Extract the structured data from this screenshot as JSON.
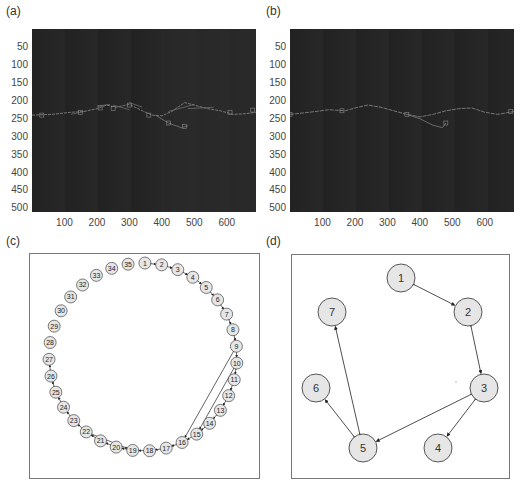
{
  "panels": {
    "a": {
      "label": "(a)"
    },
    "b": {
      "label": "(b)"
    },
    "c": {
      "label": "(c)"
    },
    "d": {
      "label": "(d)"
    }
  },
  "chart_data": [
    {
      "panel": "(a)",
      "type": "heatmap",
      "title": "",
      "description": "Grayscale image with many overlaid detected segments (boxes/lines) tracing a horizon near y=200-280",
      "xlabel": "",
      "ylabel": "",
      "xlim": [
        0,
        690
      ],
      "ylim": [
        510,
        0
      ],
      "xticks": [
        100,
        200,
        300,
        400,
        500,
        600
      ],
      "yticks": [
        50,
        100,
        150,
        200,
        250,
        300,
        350,
        400,
        450,
        500
      ],
      "trace": {
        "x": [
          0,
          60,
          120,
          160,
          200,
          230,
          260,
          300,
          340,
          370,
          400,
          430,
          470,
          500,
          540,
          580,
          620,
          660,
          690
        ],
        "y": [
          240,
          238,
          232,
          230,
          222,
          212,
          218,
          210,
          228,
          240,
          242,
          230,
          205,
          212,
          222,
          228,
          238,
          236,
          232
        ]
      },
      "branch": {
        "x": [
          380,
          420,
          460,
          480
        ],
        "y": [
          240,
          262,
          275,
          270
        ]
      },
      "grid": false
    },
    {
      "panel": "(b)",
      "type": "heatmap",
      "title": "",
      "description": "Grayscale image with a single cleaned horizon trace",
      "xlabel": "",
      "ylabel": "",
      "xlim": [
        0,
        690
      ],
      "ylim": [
        510,
        0
      ],
      "xticks": [
        100,
        200,
        300,
        400,
        500,
        600
      ],
      "yticks": [
        50,
        100,
        150,
        200,
        250,
        300,
        350,
        400,
        450,
        500
      ],
      "trace": {
        "x": [
          0,
          60,
          120,
          170,
          200,
          240,
          280,
          320,
          360,
          400,
          440,
          480,
          520,
          560,
          600,
          640,
          690
        ],
        "y": [
          238,
          232,
          225,
          228,
          220,
          212,
          218,
          228,
          238,
          245,
          238,
          228,
          222,
          220,
          232,
          238,
          230
        ]
      },
      "branch": {
        "x": [
          360,
          400,
          440,
          470,
          480
        ],
        "y": [
          238,
          250,
          268,
          275,
          262
        ]
      },
      "grid": false
    }
  ],
  "graph_c": {
    "node_count": 35,
    "nodes": [
      "1",
      "2",
      "3",
      "4",
      "5",
      "6",
      "7",
      "8",
      "9",
      "10",
      "11",
      "12",
      "13",
      "14",
      "15",
      "16",
      "17",
      "18",
      "19",
      "20",
      "21",
      "22",
      "23",
      "24",
      "25",
      "26",
      "27",
      "28",
      "29",
      "30",
      "31",
      "32",
      "33",
      "34",
      "35"
    ],
    "edges": [
      [
        1,
        2
      ],
      [
        2,
        3
      ],
      [
        3,
        4
      ],
      [
        4,
        5
      ],
      [
        5,
        6
      ],
      [
        6,
        7
      ],
      [
        7,
        8
      ],
      [
        8,
        9
      ],
      [
        9,
        10
      ],
      [
        10,
        11
      ],
      [
        11,
        12
      ],
      [
        12,
        13
      ],
      [
        13,
        14
      ],
      [
        14,
        15
      ],
      [
        15,
        16
      ],
      [
        16,
        17
      ],
      [
        17,
        18
      ],
      [
        18,
        19
      ],
      [
        19,
        20
      ],
      [
        20,
        21
      ],
      [
        21,
        22
      ],
      [
        22,
        23
      ],
      [
        23,
        24
      ],
      [
        24,
        25
      ],
      [
        25,
        26
      ],
      [
        26,
        27
      ],
      [
        9,
        16
      ],
      [
        10,
        15
      ],
      [
        22,
        19
      ]
    ]
  },
  "graph_d": {
    "nodes": [
      {
        "id": "1",
        "x": 400,
        "y": 277
      },
      {
        "id": "2",
        "x": 467,
        "y": 311
      },
      {
        "id": "3",
        "x": 483,
        "y": 387
      },
      {
        "id": "4",
        "x": 437,
        "y": 447
      },
      {
        "id": "5",
        "x": 362,
        "y": 447
      },
      {
        "id": "6",
        "x": 315,
        "y": 387
      },
      {
        "id": "7",
        "x": 331,
        "y": 311
      }
    ],
    "edges": [
      [
        1,
        2
      ],
      [
        2,
        3
      ],
      [
        3,
        4
      ],
      [
        3,
        5
      ],
      [
        5,
        6
      ],
      [
        5,
        7
      ]
    ]
  }
}
